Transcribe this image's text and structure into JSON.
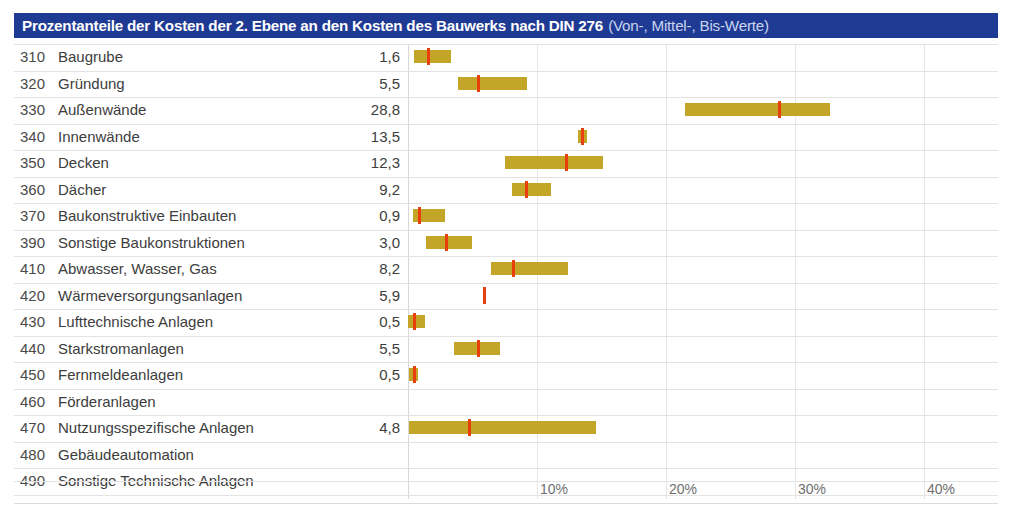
{
  "title": {
    "main": "Prozentanteile der Kosten der 2. Ebene an den Kosten des Bauwerks nach DIN 276",
    "sub": "(Von-, Mittel-, Bis-Werte)",
    "bar_color": "#1f3a93",
    "text_color": "#ffffff"
  },
  "colors": {
    "range_bar": "#c3a528",
    "mean_marker": "#e8400c",
    "gridline": "#e6e6e6",
    "row_separator": "#e3e3e3"
  },
  "chart_data": {
    "type": "bar",
    "title": "Prozentanteile der Kosten der 2. Ebene an den Kosten des Bauwerks nach DIN 276 (Von-, Mittel-, Bis-Werte)",
    "xlabel": "",
    "ylabel": "",
    "xlim": [
      0,
      45.7
    ],
    "grid": true,
    "legend": "none",
    "xticks": [
      "10%",
      "20%",
      "30%",
      "40%"
    ],
    "xtick_values": [
      10,
      20,
      30,
      40
    ],
    "columns": [
      "Kostengruppe",
      "Bezeichnung",
      "Mittelwert"
    ],
    "rows": [
      {
        "code": "310",
        "label": "Baugrube",
        "mean": "1,6",
        "mean_value": 1.6,
        "low": 0.5,
        "high": 3.3
      },
      {
        "code": "320",
        "label": "Gründung",
        "mean": "5,5",
        "mean_value": 5.5,
        "low": 3.9,
        "high": 9.2
      },
      {
        "code": "330",
        "label": "Außenwände",
        "mean": "28,8",
        "mean_value": 28.8,
        "low": 21.5,
        "high": 32.7
      },
      {
        "code": "340",
        "label": "Innenwände",
        "mean": "13,5",
        "mean_value": 13.5,
        "low": 13.2,
        "high": 13.9
      },
      {
        "code": "350",
        "label": "Decken",
        "mean": "12,3",
        "mean_value": 12.3,
        "low": 7.5,
        "high": 15.1
      },
      {
        "code": "360",
        "label": "Dächer",
        "mean": "9,2",
        "mean_value": 9.2,
        "low": 8.1,
        "high": 11.1
      },
      {
        "code": "370",
        "label": "Baukonstruktive Einbauten",
        "mean": "0,9",
        "mean_value": 0.9,
        "low": 0.4,
        "high": 2.9
      },
      {
        "code": "390",
        "label": "Sonstige Baukonstruktionen",
        "mean": "3,0",
        "mean_value": 3.0,
        "low": 1.4,
        "high": 5.0
      },
      {
        "code": "410",
        "label": "Abwasser, Wasser, Gas",
        "mean": "8,2",
        "mean_value": 8.2,
        "low": 6.4,
        "high": 12.4
      },
      {
        "code": "420",
        "label": "Wärmeversorgungsanlagen",
        "mean": "5,9",
        "mean_value": 5.9,
        "low": 5.8,
        "high": 6.0
      },
      {
        "code": "430",
        "label": "Lufttechnische Anlagen",
        "mean": "0,5",
        "mean_value": 0.5,
        "low": 0.0,
        "high": 1.3
      },
      {
        "code": "440",
        "label": "Starkstromanlagen",
        "mean": "5,5",
        "mean_value": 5.5,
        "low": 3.6,
        "high": 7.1
      },
      {
        "code": "450",
        "label": "Fernmeldeanlagen",
        "mean": "0,5",
        "mean_value": 0.5,
        "low": 0.1,
        "high": 0.8
      },
      {
        "code": "460",
        "label": "Förderanlagen",
        "mean": "",
        "mean_value": null,
        "low": null,
        "high": null
      },
      {
        "code": "470",
        "label": "Nutzungsspezifische Anlagen",
        "mean": "4,8",
        "mean_value": 4.8,
        "low": 0.1,
        "high": 14.6
      },
      {
        "code": "480",
        "label": "Gebäudeautomation",
        "mean": "",
        "mean_value": null,
        "low": null,
        "high": null
      },
      {
        "code": "490",
        "label": "Sonstige Technische Anlagen",
        "mean": "",
        "mean_value": null,
        "low": null,
        "high": null
      }
    ]
  }
}
